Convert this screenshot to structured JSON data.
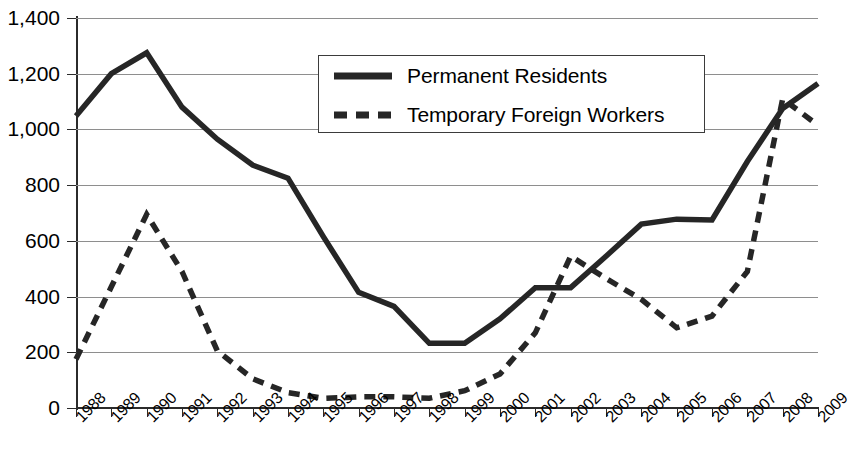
{
  "chart_data": {
    "type": "line",
    "title": "",
    "subtitle": "",
    "xlabel": "",
    "ylabel": "",
    "grid": true,
    "legend_position": "top-center",
    "ylim": [
      0,
      1400
    ],
    "yticks": [
      0,
      200,
      400,
      600,
      800,
      1000,
      1200,
      1400
    ],
    "ytick_labels": [
      "0",
      "200",
      "400",
      "600",
      "800",
      "1,000",
      "1,200",
      "1,400"
    ],
    "categories": [
      "1988",
      "1989",
      "1990",
      "1991",
      "1992",
      "1993",
      "1994",
      "1995",
      "1996",
      "1997",
      "1998",
      "1999",
      "2000",
      "2001",
      "2002",
      "2003",
      "2004",
      "2005",
      "2006",
      "2007",
      "2008",
      "2009"
    ],
    "x": [
      1988,
      1989,
      1990,
      1991,
      1992,
      1993,
      1994,
      1995,
      1996,
      1997,
      1998,
      1999,
      2000,
      2001,
      2002,
      2003,
      2004,
      2005,
      2006,
      2007,
      2008,
      2009
    ],
    "series": [
      {
        "name": "Permanent Residents",
        "style": "solid",
        "color": "#262626",
        "values": [
          1048,
          1200,
          1275,
          1080,
          965,
          872,
          825,
          615,
          415,
          365,
          232,
          232,
          320,
          432,
          432,
          545,
          660,
          678,
          675,
          885,
          1075,
          1165
        ]
      },
      {
        "name": "Temporary Foreign Workers",
        "style": "dashed",
        "color": "#262626",
        "values": [
          175,
          435,
          695,
          490,
          205,
          105,
          55,
          35,
          40,
          40,
          35,
          62,
          122,
          270,
          545,
          465,
          390,
          288,
          330,
          490,
          1110,
          1015
        ]
      }
    ]
  },
  "legend": {
    "items": [
      {
        "label": "Permanent Residents",
        "style": "solid"
      },
      {
        "label": "Temporary Foreign Workers",
        "style": "dashed"
      }
    ]
  },
  "axis": {
    "y_tick_labels": [
      "1,400",
      "1,200",
      "1,000",
      "800",
      "600",
      "400",
      "200",
      "0"
    ],
    "x_tick_labels": [
      "1988",
      "1989",
      "1990",
      "1991",
      "1992",
      "1993",
      "1994",
      "1995",
      "1996",
      "1997",
      "1998",
      "1999",
      "2000",
      "2001",
      "2002",
      "2003",
      "2004",
      "2005",
      "2006",
      "2007",
      "2008",
      "2009"
    ]
  }
}
